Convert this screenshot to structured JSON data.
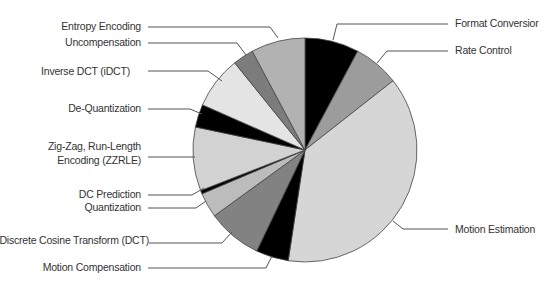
{
  "chart_data": {
    "type": "pie",
    "title": "",
    "start_angle_deg": 0,
    "direction": "clockwise",
    "center": [
      305,
      150
    ],
    "radius": 112,
    "slices": [
      {
        "label": "Format Conversior",
        "value": 7.8,
        "color": "#000000"
      },
      {
        "label": "Rate Control",
        "value": 6.6,
        "color": "#9c9c9c"
      },
      {
        "label": "Motion Estimation",
        "value": 38.0,
        "color": "#d6d6d6"
      },
      {
        "label": "Motion Compensation",
        "value": 4.7,
        "color": "#000000"
      },
      {
        "label": "Discrete Cosine Transform (DCT)",
        "value": 7.9,
        "color": "#828282"
      },
      {
        "label": "Quantization",
        "value": 3.6,
        "color": "#bcbcbc"
      },
      {
        "label": "DC Prediction",
        "value": 0.5,
        "color": "#000000"
      },
      {
        "label": "Zig-Zag, Run-Length Encoding (ZZRLE)",
        "value": 9.2,
        "color": "#d2d2d2"
      },
      {
        "label": "De-Quantization",
        "value": 3.3,
        "color": "#000000"
      },
      {
        "label": "Inverse DCT (iDCT)",
        "value": 7.6,
        "color": "#e4e4e4"
      },
      {
        "label": "Uncompensation",
        "value": 3.0,
        "color": "#7c7c7c"
      },
      {
        "label": "Entropy Encoding",
        "value": 7.8,
        "color": "#b2b2b2"
      }
    ],
    "labels": [
      {
        "lines": [
          "Entropy Encoding"
        ],
        "x": 141,
        "y": 30,
        "anchor": "end",
        "leader": [
          [
            148,
            27
          ],
          [
            270,
            27
          ],
          [
            278,
            38
          ]
        ]
      },
      {
        "lines": [
          "Uncompensation"
        ],
        "x": 141,
        "y": 46,
        "anchor": "end",
        "leader": [
          [
            148,
            43
          ],
          [
            237,
            43
          ],
          [
            246,
            55
          ]
        ]
      },
      {
        "lines": [
          "Inverse DCT (iDCT)"
        ],
        "x": 130,
        "y": 75,
        "anchor": "end",
        "leader": [
          [
            148,
            71
          ],
          [
            208,
            71
          ],
          [
            222,
            81
          ]
        ]
      },
      {
        "lines": [
          "De-Quantization"
        ],
        "x": 141,
        "y": 112,
        "anchor": "end",
        "leader": [
          [
            148,
            109
          ],
          [
            190,
            109
          ],
          [
            202,
            114
          ]
        ]
      },
      {
        "lines": [
          "Zig-Zag, Run-Length",
          "Encoding (ZZRLE)"
        ],
        "x": 141,
        "y": 157,
        "anchor": "end",
        "leader": [
          [
            148,
            157
          ],
          [
            195,
            157
          ]
        ]
      },
      {
        "lines": [
          "DC Prediction"
        ],
        "x": 141,
        "y": 198,
        "anchor": "end",
        "leader": [
          [
            148,
            195
          ],
          [
            192,
            195
          ],
          [
            204,
            188
          ]
        ]
      },
      {
        "lines": [
          "Quantization"
        ],
        "x": 141,
        "y": 211,
        "anchor": "end",
        "leader": [
          [
            148,
            208
          ],
          [
            196,
            208
          ],
          [
            206,
            201
          ]
        ]
      },
      {
        "lines": [
          "Discrete Cosine Transform (DCT)"
        ],
        "x": 149,
        "y": 244,
        "anchor": "end",
        "leader": [
          [
            149,
            243
          ],
          [
            222,
            243
          ],
          [
            232,
            232
          ]
        ]
      },
      {
        "lines": [
          "Motion Compensation"
        ],
        "x": 141,
        "y": 271,
        "anchor": "end",
        "leader": [
          [
            148,
            268
          ],
          [
            266,
            268
          ],
          [
            272,
            256
          ]
        ]
      },
      {
        "lines": [
          "Format Conversior"
        ],
        "x": 455,
        "y": 27,
        "anchor": "start",
        "leader": [
          [
            448,
            24
          ],
          [
            337,
            24
          ],
          [
            333,
            40
          ]
        ]
      },
      {
        "lines": [
          "Rate Control"
        ],
        "x": 455,
        "y": 54,
        "anchor": "start",
        "leader": [
          [
            448,
            51
          ],
          [
            387,
            51
          ],
          [
            377,
            63
          ]
        ]
      },
      {
        "lines": [
          "Motion Estimation"
        ],
        "x": 455,
        "y": 233,
        "anchor": "start",
        "leader": [
          [
            448,
            229
          ],
          [
            403,
            229
          ],
          [
            393,
            221
          ]
        ]
      }
    ],
    "xlabel": "",
    "ylabel": "",
    "legend": "none (leader-line labels)"
  }
}
